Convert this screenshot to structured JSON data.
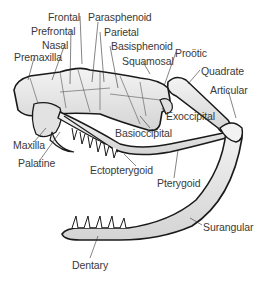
{
  "diagram": {
    "colors": {
      "ink": "#1a1a1a",
      "bone_fill": "#e8e8e8",
      "label_text": "#3a3a3a",
      "background": "#ffffff"
    },
    "labels": [
      {
        "id": "frontal",
        "text": "Frontal",
        "x": 48,
        "y": 12
      },
      {
        "id": "prefrontal",
        "text": "Prefrontal",
        "x": 31,
        "y": 26
      },
      {
        "id": "nasal",
        "text": "Nasal",
        "x": 42,
        "y": 40
      },
      {
        "id": "premaxilla",
        "text": "Premaxilla",
        "x": 14,
        "y": 52
      },
      {
        "id": "parasphenoid",
        "text": "Parasphenoid",
        "x": 88,
        "y": 12
      },
      {
        "id": "parietal",
        "text": "Parietal",
        "x": 104,
        "y": 27
      },
      {
        "id": "basisphenoid",
        "text": "Basisphenoid",
        "x": 111,
        "y": 41
      },
      {
        "id": "squamosal",
        "text": "Squamosal",
        "x": 122,
        "y": 56
      },
      {
        "id": "prootic",
        "text": "Proötic",
        "x": 175,
        "y": 48
      },
      {
        "id": "quadrate",
        "text": "Quadrate",
        "x": 201,
        "y": 66
      },
      {
        "id": "articular",
        "text": "Articular",
        "x": 210,
        "y": 85
      },
      {
        "id": "exoccipital",
        "text": "Exoccipital",
        "x": 166,
        "y": 111
      },
      {
        "id": "basioccipital",
        "text": "Basioccipital",
        "x": 115,
        "y": 128
      },
      {
        "id": "maxilla",
        "text": "Maxilla",
        "x": 13,
        "y": 140
      },
      {
        "id": "palatine",
        "text": "Palatine",
        "x": 18,
        "y": 158
      },
      {
        "id": "ectopterygoid",
        "text": "Ectopterygoid",
        "x": 90,
        "y": 165
      },
      {
        "id": "pterygoid",
        "text": "Pterygoid",
        "x": 157,
        "y": 178
      },
      {
        "id": "surangular",
        "text": "Surangular",
        "x": 203,
        "y": 222
      },
      {
        "id": "dentary",
        "text": "Dentary",
        "x": 72,
        "y": 260
      }
    ]
  }
}
